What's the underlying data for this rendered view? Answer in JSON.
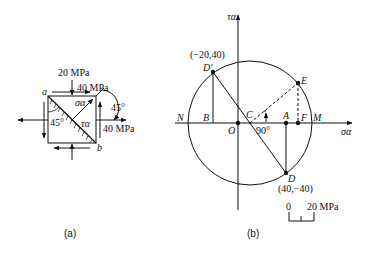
{
  "figure_a": {
    "caption": "(a)",
    "labels": {
      "top_stress": "20 MPa",
      "shear_top": "40 MPa",
      "right_stress": "40 MPa",
      "angle_right": "45°",
      "angle_inside": "45°",
      "corner_a": "a",
      "corner_b": "b",
      "sigma": "σα",
      "tau": "τα"
    }
  },
  "figure_b": {
    "caption": "(b)",
    "axis_x": "σα",
    "axis_y": "τα",
    "points": {
      "N": "N",
      "B": "B",
      "O": "O",
      "C": "C",
      "A": "A",
      "F": "F",
      "M": "M",
      "D": "D",
      "D_prime": "D′",
      "E": "E"
    },
    "coords": {
      "D_prime": "(−20,40)",
      "D": "(40,−40)"
    },
    "angle": "90°",
    "scale": {
      "zero": "0",
      "value": "20 MPa"
    }
  }
}
